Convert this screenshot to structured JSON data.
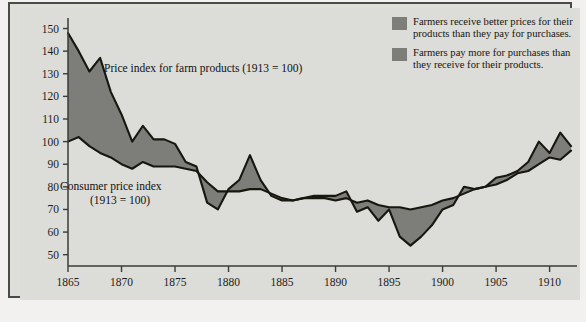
{
  "figure": {
    "background_color": "#dcdcd8",
    "frame_color": "#4a4a48",
    "series_fill_color": "#7d7d7a",
    "line_color": "#17170f"
  },
  "legend": {
    "items": [
      {
        "swatch_name": "legend-swatch-farmers-better",
        "color": "#7d7d7a",
        "text": "Farmers receive better prices for their products than they pay for purchases."
      },
      {
        "swatch_name": "legend-swatch-farmers-pay-more",
        "color": "#7d7d7a",
        "text": "Farmers pay more for purchases than they receive for their products."
      }
    ]
  },
  "annotations": {
    "farm": "Price index for farm products (1913 = 100)",
    "consumer_line1": "Consumer price index",
    "consumer_line2": "(1913 = 100)"
  },
  "chart_data": {
    "type": "area",
    "title": "",
    "xlabel": "",
    "ylabel": "",
    "xlim": [
      1865,
      1912
    ],
    "ylim": [
      45,
      152
    ],
    "grid": false,
    "legend_position": "top-right",
    "yticks": [
      50,
      60,
      70,
      80,
      90,
      100,
      110,
      120,
      130,
      140,
      150
    ],
    "xticks": [
      1865,
      1870,
      1875,
      1880,
      1885,
      1890,
      1895,
      1900,
      1905,
      1910
    ],
    "x": [
      1865,
      1866,
      1867,
      1868,
      1869,
      1870,
      1871,
      1872,
      1873,
      1874,
      1875,
      1876,
      1877,
      1878,
      1879,
      1880,
      1881,
      1882,
      1883,
      1884,
      1885,
      1886,
      1887,
      1888,
      1889,
      1890,
      1891,
      1892,
      1893,
      1894,
      1895,
      1896,
      1897,
      1898,
      1899,
      1900,
      1901,
      1902,
      1903,
      1904,
      1905,
      1906,
      1907,
      1908,
      1909,
      1910,
      1911,
      1912
    ],
    "series": [
      {
        "name": "Price index for farm products (1913 = 100)",
        "values": [
          148,
          140,
          131,
          137,
          122,
          112,
          100,
          107,
          101,
          101,
          99,
          91,
          89,
          73,
          70,
          79,
          83,
          94,
          83,
          76,
          74,
          74,
          75,
          76,
          76,
          76,
          78,
          69,
          71,
          65,
          70,
          58,
          54,
          58,
          63,
          70,
          72,
          80,
          79,
          80,
          84,
          85,
          87,
          91,
          100,
          95,
          104,
          98
        ]
      },
      {
        "name": "Consumer price index (1913 = 100)",
        "values": [
          100,
          102,
          98,
          95,
          93,
          90,
          88,
          91,
          89,
          89,
          89,
          88,
          87,
          82,
          78,
          78,
          78,
          79,
          79,
          77,
          75,
          74,
          75,
          75,
          75,
          74,
          75,
          73,
          74,
          72,
          71,
          71,
          70,
          71,
          72,
          74,
          75,
          77,
          79,
          80,
          81,
          83,
          86,
          87,
          90,
          93,
          92,
          96
        ]
      }
    ]
  }
}
